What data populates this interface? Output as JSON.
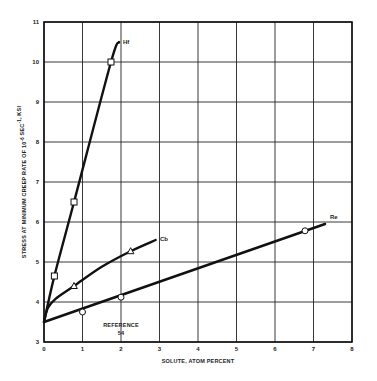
{
  "chart_data": {
    "type": "line",
    "title": "",
    "xlabel": "SOLUTE, ATOM PERCENT",
    "ylabel": "STRESS AT MINIMUM CREEP RATE OF 10^-6 SEC^-1, KSI",
    "xlim": [
      0,
      8
    ],
    "ylim": [
      3,
      11
    ],
    "x_ticks": [
      "0",
      "1",
      "2",
      "3",
      "4",
      "5",
      "6",
      "7",
      "8"
    ],
    "y_ticks": [
      "3",
      "4",
      "5",
      "6",
      "7",
      "8",
      "9",
      "10",
      "11"
    ],
    "grid": true,
    "annotation": "REFERENCE 54",
    "series": [
      {
        "name": "Hf",
        "marker": "square",
        "points": [
          [
            0.27,
            4.65
          ],
          [
            0.78,
            6.5
          ],
          [
            1.74,
            10.0
          ]
        ],
        "curve": [
          [
            0,
            3.5
          ],
          [
            0.27,
            4.65
          ],
          [
            0.78,
            6.5
          ],
          [
            1.74,
            10.0
          ],
          [
            1.95,
            10.5
          ]
        ]
      },
      {
        "name": "Cb",
        "marker": "triangle",
        "points": [
          [
            0.78,
            4.4
          ],
          [
            2.25,
            5.27
          ]
        ],
        "curve": [
          [
            0,
            3.5
          ],
          [
            0.1,
            3.85
          ],
          [
            0.3,
            4.08
          ],
          [
            0.78,
            4.4
          ],
          [
            1.5,
            4.88
          ],
          [
            2.25,
            5.27
          ],
          [
            2.9,
            5.55
          ]
        ]
      },
      {
        "name": "Re",
        "marker": "circle",
        "points": [
          [
            1.0,
            3.75
          ],
          [
            2.0,
            4.12
          ],
          [
            6.78,
            5.78
          ]
        ],
        "curve": [
          [
            0,
            3.5
          ],
          [
            7.3,
            5.95
          ]
        ]
      }
    ]
  }
}
